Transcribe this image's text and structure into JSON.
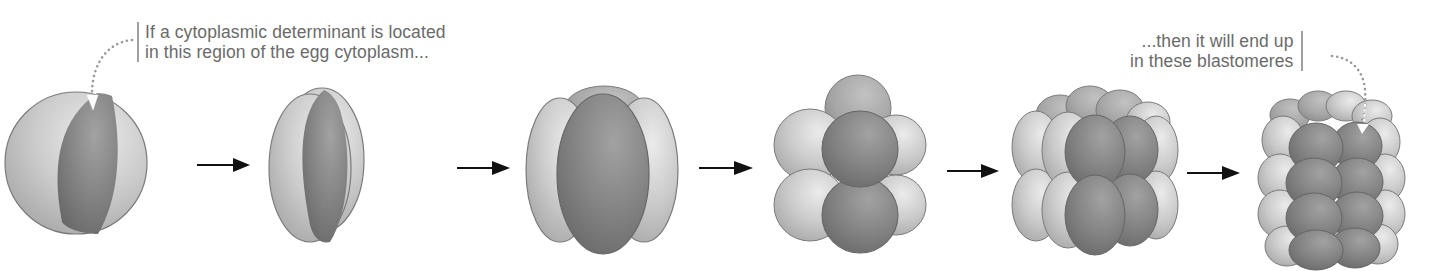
{
  "diagram": {
    "type": "process-sequence",
    "colors": {
      "determinant_region": "#7e7e7e",
      "other_cytoplasm": "#c4c4c4",
      "outline": "#6e6e6e",
      "arrow": "#111111",
      "label_text": "#6a6a6a",
      "leader_line": "#a0a0a0"
    },
    "annotations": {
      "start": {
        "lines": [
          "If a cytoplasmic determinant is located",
          "in this region of the egg cytoplasm..."
        ],
        "points_to": "stage-1"
      },
      "end": {
        "lines": [
          "...then it will end up",
          "in these blastomeres"
        ],
        "points_to": "stage-6"
      }
    },
    "stages": [
      {
        "id": "stage-1",
        "name": "egg",
        "cells": 1
      },
      {
        "id": "stage-2",
        "name": "2-cell",
        "cells": 2
      },
      {
        "id": "stage-3",
        "name": "4-cell",
        "cells": 4
      },
      {
        "id": "stage-4",
        "name": "8-cell",
        "cells": 8
      },
      {
        "id": "stage-5",
        "name": "16-cell",
        "cells": 16
      },
      {
        "id": "stage-6",
        "name": "32-cell",
        "cells": 32
      }
    ],
    "arrows": [
      {
        "from": "stage-1",
        "to": "stage-2",
        "icon": "right-arrow-icon"
      },
      {
        "from": "stage-2",
        "to": "stage-3",
        "icon": "right-arrow-icon"
      },
      {
        "from": "stage-3",
        "to": "stage-4",
        "icon": "right-arrow-icon"
      },
      {
        "from": "stage-4",
        "to": "stage-5",
        "icon": "right-arrow-icon"
      },
      {
        "from": "stage-5",
        "to": "stage-6",
        "icon": "right-arrow-icon"
      }
    ]
  }
}
